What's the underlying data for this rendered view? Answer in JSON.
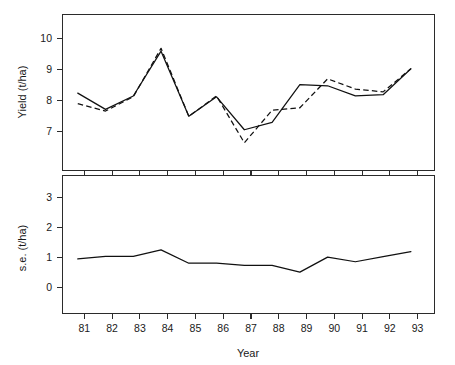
{
  "chart_data": [
    {
      "type": "line",
      "panel": "top",
      "title": "",
      "xlabel": "",
      "ylabel": "Yield  (t/ha)",
      "x": [
        81,
        82,
        83,
        84,
        85,
        86,
        87,
        88,
        89,
        90,
        91,
        92,
        93
      ],
      "categories": [
        "81",
        "82",
        "83",
        "84",
        "85",
        "86",
        "87",
        "88",
        "89",
        "90",
        "91",
        "92",
        "93"
      ],
      "series": [
        {
          "name": "solid",
          "style": "solid",
          "values": [
            8.52,
            8.12,
            8.45,
            9.55,
            7.95,
            8.43,
            7.62,
            7.8,
            8.73,
            8.7,
            8.45,
            8.48,
            9.12
          ]
        },
        {
          "name": "dashed",
          "style": "dashed",
          "values": [
            8.26,
            8.08,
            8.43,
            9.62,
            7.95,
            8.45,
            7.3,
            8.1,
            8.16,
            8.87,
            8.62,
            8.55,
            9.12
          ]
        }
      ],
      "xlim": [
        80.45,
        93.85
      ],
      "ylim": [
        6.62,
        10.45
      ],
      "yticks": [
        7,
        8,
        9,
        10
      ],
      "yticklabels": [
        "7",
        "8",
        "9",
        "10"
      ],
      "grid": false,
      "legend": "none"
    },
    {
      "type": "line",
      "panel": "bottom",
      "title": "",
      "xlabel": "Year",
      "ylabel": "s.e.  (t/ha)",
      "x": [
        81,
        82,
        83,
        84,
        85,
        86,
        87,
        88,
        89,
        90,
        91,
        92,
        93
      ],
      "categories": [
        "81",
        "82",
        "83",
        "84",
        "85",
        "86",
        "87",
        "88",
        "89",
        "90",
        "91",
        "92",
        "93"
      ],
      "series": [
        {
          "name": "standard-error",
          "style": "solid",
          "values": [
            1.1,
            1.17,
            1.17,
            1.35,
            0.98,
            0.98,
            0.92,
            0.92,
            0.73,
            1.15,
            1.02,
            1.16,
            1.3
          ]
        }
      ],
      "xlim": [
        80.45,
        93.85
      ],
      "ylim": [
        -0.42,
        3.42
      ],
      "yticks": [
        0,
        1,
        2,
        3
      ],
      "yticklabels": [
        "0",
        "1",
        "2",
        "3"
      ],
      "xticks": [
        81,
        82,
        83,
        84,
        85,
        86,
        87,
        88,
        89,
        90,
        91,
        92,
        93
      ],
      "xticklabels": [
        "81",
        "82",
        "83",
        "84",
        "85",
        "86",
        "87",
        "88",
        "89",
        "90",
        "91",
        "92",
        "93"
      ],
      "grid": false,
      "legend": "none"
    }
  ],
  "labels": {
    "top_ylabel": "Yield  (t/ha)",
    "bottom_ylabel": "s.e.  (t/ha)",
    "xlabel": "Year",
    "top_yticks": [
      "7",
      "8",
      "9",
      "10"
    ],
    "bottom_yticks": [
      "0",
      "1",
      "2",
      "3"
    ],
    "xticks": [
      "81",
      "82",
      "83",
      "84",
      "85",
      "86",
      "87",
      "88",
      "89",
      "90",
      "91",
      "92",
      "93"
    ]
  },
  "colors": {
    "line": "#111111",
    "axis": "#2b2b2b",
    "text": "#1a1a1a",
    "background": "#ffffff"
  }
}
